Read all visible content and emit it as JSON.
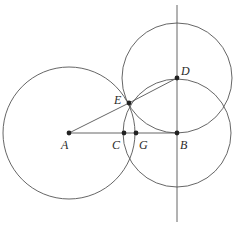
{
  "diagram": {
    "type": "geometric-construction",
    "points": [
      {
        "id": "A",
        "label": "A"
      },
      {
        "id": "B",
        "label": "B"
      },
      {
        "id": "C",
        "label": "C"
      },
      {
        "id": "D",
        "label": "D"
      },
      {
        "id": "E",
        "label": "E"
      },
      {
        "id": "G",
        "label": "G"
      }
    ],
    "segments": [
      {
        "from": "A",
        "to": "B"
      },
      {
        "from": "A",
        "to": "E"
      },
      {
        "from": "E",
        "to": "D"
      }
    ],
    "lines": [
      {
        "through": "B",
        "direction": "perpendicular to AB",
        "description": "vertical line through B and D"
      }
    ],
    "circles": [
      {
        "center": "A",
        "through": "G",
        "description": "large circle centered at A"
      },
      {
        "center": "B",
        "through": "C",
        "description": "circle centered at B"
      },
      {
        "center": "D",
        "through": "E",
        "description": "circle centered at D"
      }
    ],
    "colors": {
      "stroke": "#555555",
      "point": "#222222",
      "background": "#ffffff"
    }
  }
}
